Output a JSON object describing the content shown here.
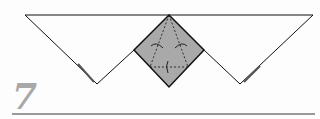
{
  "diagram": {
    "type": "origami-fold-step",
    "step_number": "7",
    "colors": {
      "paper_front": "#ffffff",
      "paper_back": "#a9a9a9",
      "line": "#111111",
      "step_number": "#a8a8a8",
      "rule": "#9a9a9a"
    },
    "annotations": [
      "fold-arrow-left",
      "fold-arrow-right",
      "fold-arrow-bottom"
    ]
  }
}
